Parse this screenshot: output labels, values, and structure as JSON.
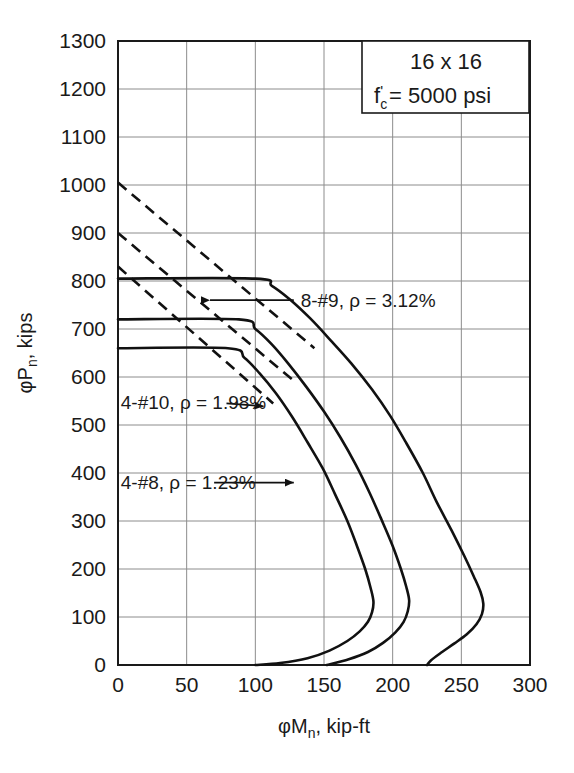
{
  "chart_data": {
    "type": "line",
    "title": "",
    "xlabel": "φMₙ, kip-ft",
    "ylabel": "φPₙ, kips",
    "xlim": [
      0,
      300
    ],
    "ylim": [
      0,
      1300
    ],
    "xticks": [
      0,
      50,
      100,
      150,
      200,
      250,
      300
    ],
    "yticks": [
      0,
      100,
      200,
      300,
      400,
      500,
      600,
      700,
      800,
      900,
      1000,
      1100,
      1200,
      1300
    ],
    "grid": true,
    "legend_position": "none",
    "annotation_box": {
      "line1": "16 x 16",
      "line2_prefix": "f",
      "line2_sub": "c",
      "line2_prime": "'",
      "line2_rest": " = 5000 psi"
    },
    "series": [
      {
        "name": "8-#9, ρ = 3.12%",
        "label": "8-#9, ρ = 3.12%",
        "rho_percent": 3.12,
        "bars": "8-#9",
        "style": "solid",
        "cap_load": 805,
        "cap_moment_end": 100,
        "dashed_start_load": 1005,
        "points": [
          [
            0,
            805
          ],
          [
            100,
            805
          ],
          [
            112,
            790
          ],
          [
            125,
            762
          ],
          [
            140,
            722
          ],
          [
            155,
            676
          ],
          [
            170,
            628
          ],
          [
            185,
            574
          ],
          [
            198,
            520
          ],
          [
            210,
            462
          ],
          [
            222,
            400
          ],
          [
            232,
            340
          ],
          [
            243,
            280
          ],
          [
            252,
            228
          ],
          [
            259,
            185
          ],
          [
            264,
            152
          ],
          [
            266,
            128
          ],
          [
            265,
            106
          ],
          [
            261,
            85
          ],
          [
            254,
            64
          ],
          [
            245,
            45
          ],
          [
            236,
            27
          ],
          [
            228,
            10
          ],
          [
            225,
            0
          ]
        ]
      },
      {
        "name": "4-#10, ρ = 1.98%",
        "label": "4-#10, ρ = 1.98%",
        "rho_percent": 1.98,
        "bars": "4-#10",
        "style": "solid",
        "cap_load": 720,
        "cap_moment_end": 88,
        "dashed_start_load": 900,
        "points": [
          [
            0,
            720
          ],
          [
            88,
            720
          ],
          [
            100,
            700
          ],
          [
            112,
            668
          ],
          [
            124,
            628
          ],
          [
            137,
            580
          ],
          [
            150,
            528
          ],
          [
            162,
            474
          ],
          [
            173,
            418
          ],
          [
            183,
            360
          ],
          [
            192,
            302
          ],
          [
            200,
            248
          ],
          [
            206,
            200
          ],
          [
            210,
            162
          ],
          [
            212,
            135
          ],
          [
            211,
            112
          ],
          [
            208,
            90
          ],
          [
            202,
            68
          ],
          [
            193,
            46
          ],
          [
            182,
            27
          ],
          [
            168,
            12
          ],
          [
            152,
            0
          ]
        ]
      },
      {
        "name": "4-#8, ρ = 1.23%",
        "label": "4-#8, ρ = 1.23%",
        "rho_percent": 1.23,
        "bars": "4-#8",
        "style": "solid",
        "cap_load": 660,
        "cap_moment_end": 80,
        "dashed_start_load": 830,
        "points": [
          [
            0,
            660
          ],
          [
            80,
            660
          ],
          [
            92,
            640
          ],
          [
            103,
            608
          ],
          [
            115,
            566
          ],
          [
            127,
            516
          ],
          [
            138,
            464
          ],
          [
            149,
            410
          ],
          [
            158,
            356
          ],
          [
            167,
            300
          ],
          [
            174,
            248
          ],
          [
            180,
            200
          ],
          [
            184,
            160
          ],
          [
            186,
            132
          ],
          [
            185,
            110
          ],
          [
            182,
            90
          ],
          [
            176,
            70
          ],
          [
            167,
            50
          ],
          [
            154,
            30
          ],
          [
            138,
            14
          ],
          [
            118,
            4
          ],
          [
            100,
            0
          ]
        ]
      }
    ],
    "dashed_lines": [
      {
        "name": "dashed-8-9",
        "from": [
          0,
          1005
        ],
        "to": [
          143,
          660
        ]
      },
      {
        "name": "dashed-4-10",
        "from": [
          0,
          900
        ],
        "to": [
          128,
          592
        ]
      },
      {
        "name": "dashed-4-8",
        "from": [
          0,
          830
        ],
        "to": [
          113,
          545
        ]
      }
    ],
    "annotations": [
      {
        "name": "anno-8-9",
        "text": "8-#9, ρ = 3.12%",
        "text_x": 133,
        "text_y": 760,
        "arrow_from": [
          128,
          760
        ],
        "arrow_to": [
          67,
          760
        ],
        "align": "start"
      },
      {
        "name": "anno-4-10",
        "text": "4-#10, ρ = 1.98%",
        "text_x": 2,
        "text_y": 548,
        "arrow_from": [
          79,
          545
        ],
        "arrow_to": [
          106,
          539
        ],
        "align": "start"
      },
      {
        "name": "anno-4-8",
        "text": "4-#8, ρ = 1.23%",
        "text_x": 2,
        "text_y": 382,
        "arrow_from": [
          70,
          380
        ],
        "arrow_to": [
          128,
          380
        ],
        "align": "start"
      }
    ]
  },
  "colors": {
    "axis": "#1a1a1a",
    "grid": "#8c8c8c",
    "curve": "#111111",
    "background": "#ffffff"
  }
}
